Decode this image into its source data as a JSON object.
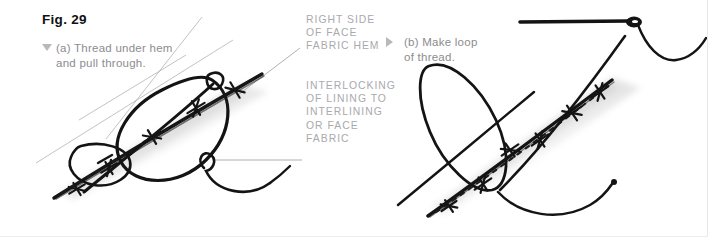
{
  "figure": {
    "title": "Fig. 29",
    "background_color": "#ffffff",
    "ink_color": "#1a1a1a",
    "annotation_color": "#a9a9ae",
    "caption_color": "#8c8c90",
    "width": 708,
    "height": 237
  },
  "panels": [
    {
      "id": "a",
      "bullet": "triangle-down",
      "caption": "(a) Thread under hem\nand pull through."
    },
    {
      "id": "b",
      "bullet": "triangle-right",
      "caption": "(b) Make loop\nof thread."
    }
  ],
  "annotations": [
    {
      "id": "right-side-of-face-fabric-hem",
      "text": "RIGHT SIDE\nOF FACE\nFABRIC HEM"
    },
    {
      "id": "interlocking-of-lining",
      "text": "INTERLOCKING\nOF LINING TO\nINTERLINING\nOR FACE\nFABRIC"
    }
  ],
  "illustration": {
    "description": "Hand-drawn pen sketch of hemming stitch technique",
    "elements": [
      "fabric-edge-line",
      "dashed-stitch-line",
      "cross-stitch-marks",
      "thread-loop",
      "sewing-needle",
      "leader-line"
    ]
  }
}
